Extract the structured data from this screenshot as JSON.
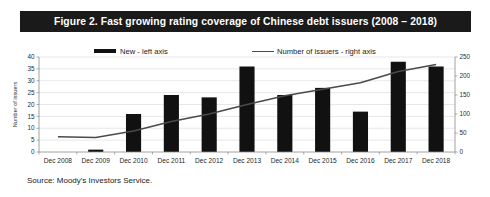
{
  "figure": {
    "title": "Figure 2.  Fast growing rating coverage of Chinese debt issuers (2008 – 2018)",
    "source": "Source: Moody's Investors Service.",
    "title_bar_color": "#1a1a1a",
    "bar_color": "#111111",
    "line_color": "#4a4a4a"
  },
  "chart_data": {
    "type": "bar",
    "title": "Figure 2.  Fast growing rating coverage of Chinese debt issuers (2008 – 2018)",
    "xlabel": "",
    "ylabel": "Number of issuers",
    "categories": [
      "Dec 2008",
      "Dec 2009",
      "Dec 2010",
      "Dec 2011",
      "Dec 2012",
      "Dec 2013",
      "Dec 2014",
      "Dec 2015",
      "Dec 2016",
      "Dec 2017",
      "Dec 2018"
    ],
    "series": [
      {
        "name": "New - left axis",
        "type": "bar",
        "axis": "left",
        "values": [
          0,
          1,
          16,
          24,
          23,
          36,
          24,
          27,
          17,
          38,
          36
        ]
      },
      {
        "name": "Number of issuers - right axis",
        "type": "line",
        "axis": "right",
        "values": [
          40,
          38,
          55,
          80,
          100,
          125,
          148,
          165,
          182,
          212,
          230
        ]
      }
    ],
    "left_axis": {
      "label": "Number of issuers",
      "ticks": [
        0,
        5,
        10,
        15,
        20,
        25,
        30,
        35,
        40
      ],
      "ylim": [
        0,
        40
      ]
    },
    "right_axis": {
      "label": "",
      "ticks": [
        0,
        50,
        100,
        150,
        200,
        250
      ],
      "ylim": [
        0,
        250
      ]
    },
    "legend": {
      "position": "top",
      "entries": [
        "New - left axis",
        "Number of issuers - right axis"
      ]
    },
    "grid": true
  }
}
